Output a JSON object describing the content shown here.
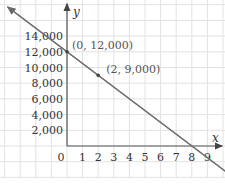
{
  "chart_data": {
    "type": "line",
    "title": "",
    "xlabel": "x",
    "ylabel": "y",
    "x_ticks": [
      "0",
      "1",
      "2",
      "3",
      "4",
      "5",
      "6",
      "7",
      "8",
      "9"
    ],
    "y_ticks": [
      "2,000",
      "4,000",
      "6,000",
      "8,000",
      "10,000",
      "12,000",
      "14,000"
    ],
    "xlim": [
      0,
      9
    ],
    "ylim": [
      0,
      14000
    ],
    "grid": true,
    "series": [
      {
        "name": "line",
        "x": [
          0,
          2,
          8
        ],
        "y": [
          12000,
          9000,
          0
        ],
        "equation": "y = -1500x + 12000"
      }
    ],
    "annotations": [
      {
        "text": "(0, 12,000)",
        "x": 0,
        "y": 12000
      },
      {
        "text": "(2, 9,000)",
        "x": 2,
        "y": 9000
      }
    ],
    "colors": {
      "line": "#707070",
      "grid": "#e2e2e2",
      "axis": "#555555"
    }
  }
}
